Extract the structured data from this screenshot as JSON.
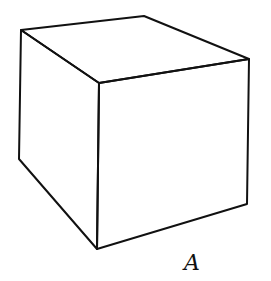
{
  "figure": {
    "label": "A",
    "shape": "cube",
    "stroke_color": "#111111",
    "background": "#ffffff"
  }
}
